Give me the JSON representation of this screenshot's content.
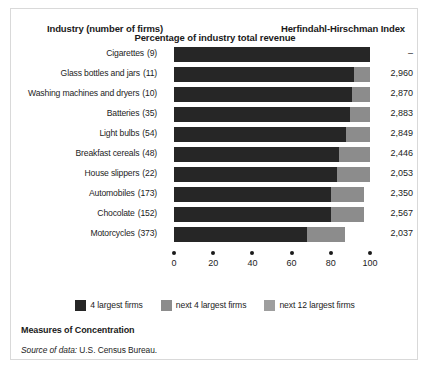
{
  "figure": {
    "header_industry": "Industry (number of firms)",
    "header_hhi": "Herfindahl-Hirschman Index",
    "caption": "Measures of Concentration",
    "source_prefix": "Source of data:",
    "source_value": "U.S. Census Bureau.",
    "colors": {
      "seg1": "#262626",
      "seg2": "#8c8c8c",
      "seg3": "#9e9e9e",
      "text": "#1c1c1c",
      "background": "#ffffff",
      "border": "#d9d9d9"
    }
  },
  "chart_data": {
    "type": "bar",
    "orientation": "horizontal",
    "stacked": true,
    "title": "Measures of Concentration",
    "xlabel": "Percentage of industry total revenue",
    "ylabel": "Industry (number of firms)",
    "xlim": [
      0,
      100
    ],
    "xticks": [
      0,
      20,
      40,
      60,
      80,
      100
    ],
    "xticklabels": [
      "0",
      "20",
      "40",
      "60",
      "80",
      "100"
    ],
    "grid": false,
    "legend_position": "bottom",
    "legend": [
      "4 largest firms",
      "next 4 largest firms",
      "next 12 largest firms"
    ],
    "series": [
      {
        "name": "4 largest firms",
        "color": "#262626",
        "values": [
          100,
          92,
          91,
          90,
          88,
          84,
          83,
          80,
          80,
          68
        ]
      },
      {
        "name": "next 4 largest firms",
        "color": "#8c8c8c",
        "values": [
          0,
          8,
          9,
          10,
          12,
          16,
          17,
          17,
          17,
          19
        ]
      },
      {
        "name": "next 12 largest firms",
        "color": "#9e9e9e",
        "values": [
          0,
          0,
          0,
          0,
          0,
          0,
          0,
          0,
          0,
          0
        ]
      }
    ],
    "categories": [
      "Cigarettes",
      "Glass bottles and jars",
      "Washing machines and dryers",
      "Batteries",
      "Light bulbs",
      "Breakfast cereals",
      "House slippers",
      "Automobiles",
      "Chocolate",
      "Motorcycles"
    ],
    "rows": [
      {
        "industry": "Cigarettes",
        "firms": "(9)",
        "hhi": "–",
        "seg1": 100,
        "seg2": 0,
        "seg3": 0
      },
      {
        "industry": "Glass bottles and jars",
        "firms": "(11)",
        "hhi": "2,960",
        "seg1": 92,
        "seg2": 8,
        "seg3": 0
      },
      {
        "industry": "Washing machines and dryers",
        "firms": "(10)",
        "hhi": "2,870",
        "seg1": 91,
        "seg2": 9,
        "seg3": 0
      },
      {
        "industry": "Batteries",
        "firms": "(35)",
        "hhi": "2,883",
        "seg1": 90,
        "seg2": 10,
        "seg3": 0
      },
      {
        "industry": "Light bulbs",
        "firms": "(54)",
        "hhi": "2,849",
        "seg1": 88,
        "seg2": 12,
        "seg3": 0
      },
      {
        "industry": "Breakfast cereals",
        "firms": "(48)",
        "hhi": "2,446",
        "seg1": 84,
        "seg2": 16,
        "seg3": 0
      },
      {
        "industry": "House slippers",
        "firms": "(22)",
        "hhi": "2,053",
        "seg1": 83,
        "seg2": 17,
        "seg3": 0
      },
      {
        "industry": "Automobiles",
        "firms": "(173)",
        "hhi": "2,350",
        "seg1": 80,
        "seg2": 17,
        "seg3": 0
      },
      {
        "industry": "Chocolate",
        "firms": "(152)",
        "hhi": "2,567",
        "seg1": 80,
        "seg2": 17,
        "seg3": 0
      },
      {
        "industry": "Motorcycles",
        "firms": "(373)",
        "hhi": "2,037",
        "seg1": 68,
        "seg2": 19,
        "seg3": 0
      }
    ]
  }
}
